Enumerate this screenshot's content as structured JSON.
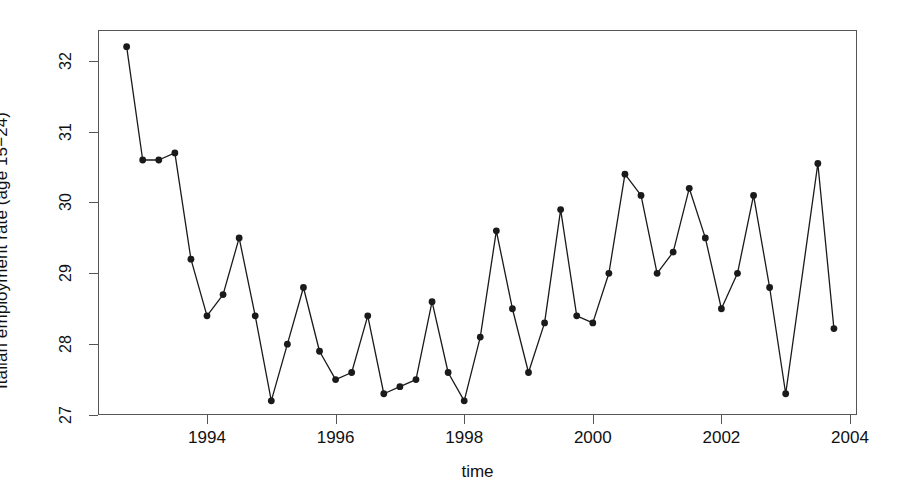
{
  "chart_data": {
    "type": "line",
    "title": "",
    "xlabel": "time",
    "ylabel": "Italian employment rate (age 15−24)",
    "xlim": [
      1992.75,
      12004.0
    ],
    "x_range": [
      1992.6,
      2004.05
    ],
    "ylim": [
      26.9,
      32.45
    ],
    "grid": false,
    "legend": null,
    "marker": "filled-circle",
    "line_color": "#1a1a1a",
    "frame_color": "#555555",
    "xticks": [
      1994,
      1996,
      1998,
      2000,
      2002,
      2004
    ],
    "xtick_labels": [
      "1994",
      "1996",
      "1998",
      "2000",
      "2002",
      "2004"
    ],
    "yticks": [
      27,
      28,
      29,
      30,
      31,
      32
    ],
    "ytick_labels": [
      "27",
      "28",
      "29",
      "30",
      "31",
      "32"
    ],
    "x": [
      1992.75,
      1993.0,
      1993.25,
      1993.5,
      1993.75,
      1994.0,
      1994.25,
      1994.5,
      1994.75,
      1995.0,
      1995.25,
      1995.5,
      1995.75,
      1996.0,
      1996.25,
      1996.5,
      1996.75,
      1997.0,
      1997.25,
      1997.5,
      1997.75,
      1998.0,
      1998.25,
      1998.5,
      1998.75,
      1999.0,
      1999.25,
      1999.5,
      1999.75,
      2000.0,
      2000.25,
      2000.5,
      2000.75,
      2001.0,
      2001.25,
      2001.5,
      2001.75,
      2002.0,
      2002.25,
      2002.5,
      2002.75,
      2003.0,
      2003.5,
      2003.75
    ],
    "values": [
      32.2,
      30.6,
      30.6,
      30.7,
      29.2,
      28.4,
      28.7,
      29.5,
      28.4,
      27.2,
      28.0,
      28.8,
      27.9,
      27.5,
      27.6,
      28.4,
      27.3,
      27.4,
      27.5,
      28.6,
      27.6,
      27.2,
      28.1,
      29.6,
      28.5,
      27.6,
      28.3,
      29.9,
      28.4,
      28.3,
      29.0,
      30.4,
      30.1,
      29.0,
      29.3,
      30.2,
      29.5,
      28.5,
      29.0,
      30.1,
      28.8,
      27.3,
      30.55,
      28.22
    ],
    "n_points": 44,
    "series_name": "Italian employment rate (age 15-24)"
  },
  "axes": {
    "x_title": "time",
    "y_title": "Italian employment rate (age 15−24)"
  }
}
